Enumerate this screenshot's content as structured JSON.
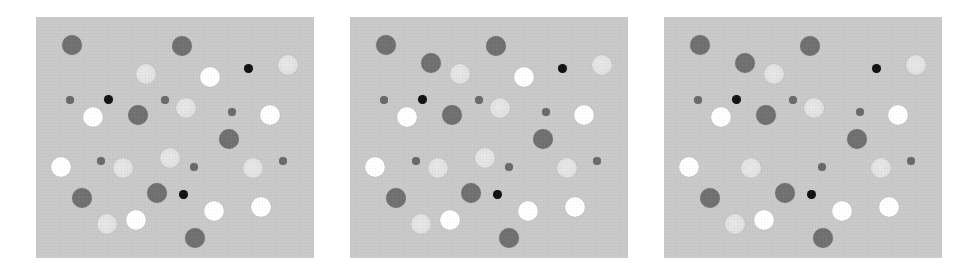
{
  "figure": {
    "background_color": "#c9c9c9",
    "colors": {
      "dark_gray": "#6f6f6f",
      "small_dark_gray": "#6a6a6a",
      "light": "#e1e1e1",
      "white": "#ffffff",
      "black": "#111111"
    },
    "panels": [
      {
        "id": "panel-1",
        "left": 36,
        "circles": [
          {
            "c": "dark_gray",
            "x": 36,
            "y": 28,
            "r": 10
          },
          {
            "c": "dark_gray",
            "x": 146,
            "y": 29,
            "r": 10
          },
          {
            "c": "light",
            "x": 110,
            "y": 57,
            "r": 10
          },
          {
            "c": "white",
            "x": 174,
            "y": 60,
            "r": 10
          },
          {
            "c": "black",
            "x": 212,
            "y": 51,
            "r": 4.5
          },
          {
            "c": "light",
            "x": 252,
            "y": 48,
            "r": 10
          },
          {
            "c": "small_dark_gray",
            "x": 34,
            "y": 83,
            "r": 4
          },
          {
            "c": "black",
            "x": 72,
            "y": 82,
            "r": 4.5
          },
          {
            "c": "small_dark_gray",
            "x": 129,
            "y": 83,
            "r": 4
          },
          {
            "c": "light",
            "x": 150,
            "y": 91,
            "r": 10
          },
          {
            "c": "small_dark_gray",
            "x": 196,
            "y": 95,
            "r": 4
          },
          {
            "c": "white",
            "x": 57,
            "y": 100,
            "r": 10
          },
          {
            "c": "dark_gray",
            "x": 102,
            "y": 98,
            "r": 10
          },
          {
            "c": "white",
            "x": 234,
            "y": 98,
            "r": 10
          },
          {
            "c": "dark_gray",
            "x": 193,
            "y": 122,
            "r": 10
          },
          {
            "c": "white",
            "x": 25,
            "y": 150,
            "r": 10
          },
          {
            "c": "small_dark_gray",
            "x": 65,
            "y": 144,
            "r": 4
          },
          {
            "c": "light",
            "x": 87,
            "y": 151,
            "r": 10
          },
          {
            "c": "light",
            "x": 134,
            "y": 141,
            "r": 10
          },
          {
            "c": "small_dark_gray",
            "x": 158,
            "y": 150,
            "r": 4
          },
          {
            "c": "light",
            "x": 217,
            "y": 151,
            "r": 10
          },
          {
            "c": "small_dark_gray",
            "x": 247,
            "y": 144,
            "r": 4
          },
          {
            "c": "dark_gray",
            "x": 46,
            "y": 181,
            "r": 10
          },
          {
            "c": "dark_gray",
            "x": 121,
            "y": 176,
            "r": 10
          },
          {
            "c": "black",
            "x": 147,
            "y": 177,
            "r": 4.5
          },
          {
            "c": "white",
            "x": 178,
            "y": 194,
            "r": 10
          },
          {
            "c": "white",
            "x": 225,
            "y": 190,
            "r": 10
          },
          {
            "c": "light",
            "x": 71,
            "y": 207,
            "r": 10
          },
          {
            "c": "white",
            "x": 100,
            "y": 203,
            "r": 10
          },
          {
            "c": "dark_gray",
            "x": 159,
            "y": 221,
            "r": 10
          }
        ]
      },
      {
        "id": "panel-2",
        "left": 350,
        "circles": [
          {
            "c": "dark_gray",
            "x": 36,
            "y": 28,
            "r": 10
          },
          {
            "c": "dark_gray",
            "x": 81,
            "y": 46,
            "r": 10
          },
          {
            "c": "dark_gray",
            "x": 146,
            "y": 29,
            "r": 10
          },
          {
            "c": "light",
            "x": 110,
            "y": 57,
            "r": 10
          },
          {
            "c": "white",
            "x": 174,
            "y": 60,
            "r": 10
          },
          {
            "c": "black",
            "x": 212,
            "y": 51,
            "r": 4.5
          },
          {
            "c": "light",
            "x": 252,
            "y": 48,
            "r": 10
          },
          {
            "c": "small_dark_gray",
            "x": 34,
            "y": 83,
            "r": 4
          },
          {
            "c": "black",
            "x": 72,
            "y": 82,
            "r": 4.5
          },
          {
            "c": "small_dark_gray",
            "x": 129,
            "y": 83,
            "r": 4
          },
          {
            "c": "light",
            "x": 150,
            "y": 91,
            "r": 10
          },
          {
            "c": "small_dark_gray",
            "x": 196,
            "y": 95,
            "r": 4
          },
          {
            "c": "white",
            "x": 57,
            "y": 100,
            "r": 10
          },
          {
            "c": "dark_gray",
            "x": 102,
            "y": 98,
            "r": 10
          },
          {
            "c": "white",
            "x": 234,
            "y": 98,
            "r": 10
          },
          {
            "c": "dark_gray",
            "x": 193,
            "y": 122,
            "r": 10
          },
          {
            "c": "white",
            "x": 25,
            "y": 150,
            "r": 10
          },
          {
            "c": "small_dark_gray",
            "x": 66,
            "y": 144,
            "r": 4
          },
          {
            "c": "light",
            "x": 88,
            "y": 151,
            "r": 10
          },
          {
            "c": "light",
            "x": 135,
            "y": 141,
            "r": 10
          },
          {
            "c": "small_dark_gray",
            "x": 159,
            "y": 150,
            "r": 4
          },
          {
            "c": "light",
            "x": 217,
            "y": 151,
            "r": 10
          },
          {
            "c": "small_dark_gray",
            "x": 247,
            "y": 144,
            "r": 4
          },
          {
            "c": "dark_gray",
            "x": 46,
            "y": 181,
            "r": 10
          },
          {
            "c": "dark_gray",
            "x": 121,
            "y": 176,
            "r": 10
          },
          {
            "c": "black",
            "x": 147,
            "y": 177,
            "r": 4.5
          },
          {
            "c": "white",
            "x": 178,
            "y": 194,
            "r": 10
          },
          {
            "c": "white",
            "x": 225,
            "y": 190,
            "r": 10
          },
          {
            "c": "light",
            "x": 71,
            "y": 207,
            "r": 10
          },
          {
            "c": "white",
            "x": 100,
            "y": 203,
            "r": 10
          },
          {
            "c": "dark_gray",
            "x": 159,
            "y": 221,
            "r": 10
          }
        ]
      },
      {
        "id": "panel-3",
        "left": 664,
        "circles": [
          {
            "c": "dark_gray",
            "x": 36,
            "y": 28,
            "r": 10
          },
          {
            "c": "dark_gray",
            "x": 81,
            "y": 46,
            "r": 10
          },
          {
            "c": "dark_gray",
            "x": 146,
            "y": 29,
            "r": 10
          },
          {
            "c": "light",
            "x": 110,
            "y": 57,
            "r": 10
          },
          {
            "c": "black",
            "x": 212,
            "y": 51,
            "r": 4.5
          },
          {
            "c": "light",
            "x": 252,
            "y": 48,
            "r": 10
          },
          {
            "c": "small_dark_gray",
            "x": 34,
            "y": 83,
            "r": 4
          },
          {
            "c": "black",
            "x": 72,
            "y": 82,
            "r": 4.5
          },
          {
            "c": "small_dark_gray",
            "x": 129,
            "y": 83,
            "r": 4
          },
          {
            "c": "light",
            "x": 150,
            "y": 91,
            "r": 10
          },
          {
            "c": "small_dark_gray",
            "x": 196,
            "y": 95,
            "r": 4
          },
          {
            "c": "white",
            "x": 57,
            "y": 100,
            "r": 10
          },
          {
            "c": "dark_gray",
            "x": 102,
            "y": 98,
            "r": 10
          },
          {
            "c": "white",
            "x": 234,
            "y": 98,
            "r": 10
          },
          {
            "c": "dark_gray",
            "x": 193,
            "y": 122,
            "r": 10
          },
          {
            "c": "white",
            "x": 25,
            "y": 150,
            "r": 10
          },
          {
            "c": "light",
            "x": 87,
            "y": 151,
            "r": 10
          },
          {
            "c": "small_dark_gray",
            "x": 158,
            "y": 150,
            "r": 4
          },
          {
            "c": "light",
            "x": 217,
            "y": 151,
            "r": 10
          },
          {
            "c": "small_dark_gray",
            "x": 247,
            "y": 144,
            "r": 4
          },
          {
            "c": "dark_gray",
            "x": 46,
            "y": 181,
            "r": 10
          },
          {
            "c": "dark_gray",
            "x": 121,
            "y": 176,
            "r": 10
          },
          {
            "c": "black",
            "x": 147,
            "y": 177,
            "r": 4.5
          },
          {
            "c": "white",
            "x": 178,
            "y": 194,
            "r": 10
          },
          {
            "c": "white",
            "x": 225,
            "y": 190,
            "r": 10
          },
          {
            "c": "light",
            "x": 71,
            "y": 207,
            "r": 10
          },
          {
            "c": "white",
            "x": 100,
            "y": 203,
            "r": 10
          },
          {
            "c": "dark_gray",
            "x": 159,
            "y": 221,
            "r": 10
          }
        ]
      }
    ]
  }
}
